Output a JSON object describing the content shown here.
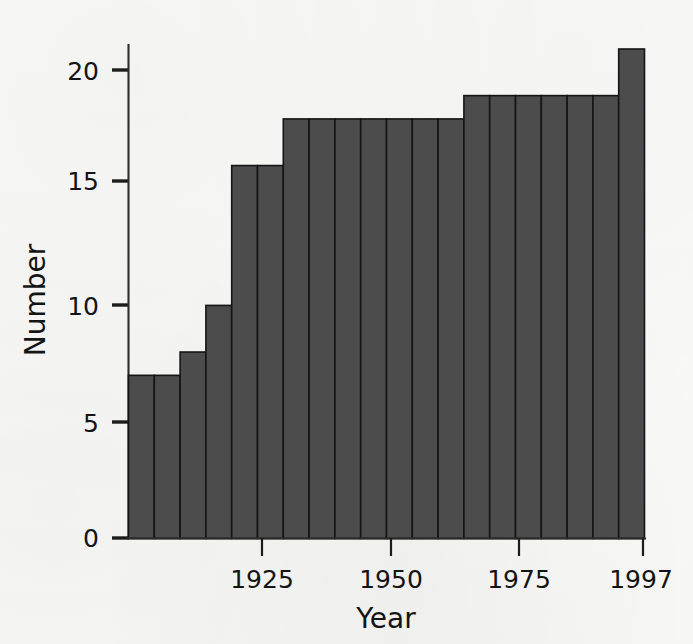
{
  "chart_data": {
    "type": "bar",
    "title": "",
    "subtitle": "",
    "xlabel": "Year",
    "ylabel": "Number",
    "grid": false,
    "legend": null,
    "legend_position": "none",
    "orientation": "vertical",
    "bar_style": "histogram-adjacent",
    "xlim": [
      1897,
      1997
    ],
    "ylim": [
      0,
      21
    ],
    "bin_width_years": 5,
    "x_tick_labels": [
      "1925",
      "1950",
      "1975",
      "1997"
    ],
    "x_tick_values": [
      1925,
      1950,
      1975,
      1997
    ],
    "y_tick_labels": [
      "0",
      "5",
      "10",
      "15",
      "20"
    ],
    "y_tick_values": [
      0,
      5,
      10,
      15,
      20
    ],
    "categories": [
      "1897",
      "1902",
      "1907",
      "1912",
      "1917",
      "1922",
      "1927",
      "1932",
      "1937",
      "1942",
      "1947",
      "1952",
      "1957",
      "1962",
      "1967",
      "1972",
      "1977",
      "1982",
      "1987",
      "1992"
    ],
    "values": [
      7,
      7,
      8,
      10,
      16,
      16,
      18,
      18,
      18,
      18,
      18,
      18,
      18,
      19,
      19,
      19,
      19,
      19,
      19,
      21
    ],
    "annotations": [],
    "colors": {
      "bar_fill": "#4c4c4c",
      "bar_stroke": "#151515",
      "axis": "#2b2b2b",
      "text": "#141414",
      "background": "#fbfbfa"
    }
  },
  "axes": {
    "y_axis_title": "Number",
    "x_axis_title": "Year"
  }
}
